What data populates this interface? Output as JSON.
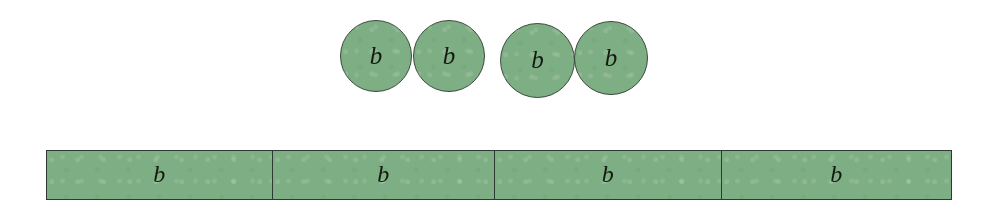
{
  "figure": {
    "background_color": "#ffffff",
    "shape_fill_color": "#7eae84",
    "shape_stroke_color": "#2e3a30",
    "label_color": "#16180f"
  },
  "circle_row": {
    "name": "circle-model-row",
    "count": 4,
    "circles": [
      {
        "label": "b",
        "left": 340,
        "top": 20,
        "size": 72
      },
      {
        "label": "b",
        "left": 413,
        "top": 20,
        "size": 72
      },
      {
        "label": "b",
        "left": 500,
        "top": 23,
        "size": 75
      },
      {
        "label": "b",
        "left": 574,
        "top": 21,
        "size": 74
      }
    ]
  },
  "bar_model": {
    "name": "bar-model",
    "left": 46,
    "top": 150,
    "width": 906,
    "height": 50,
    "segment_count": 4,
    "segments": [
      {
        "label": "b",
        "width_px": 225
      },
      {
        "label": "b",
        "width_px": 223
      },
      {
        "label": "b",
        "width_px": 227
      },
      {
        "label": "b",
        "width_px": 231
      }
    ]
  }
}
